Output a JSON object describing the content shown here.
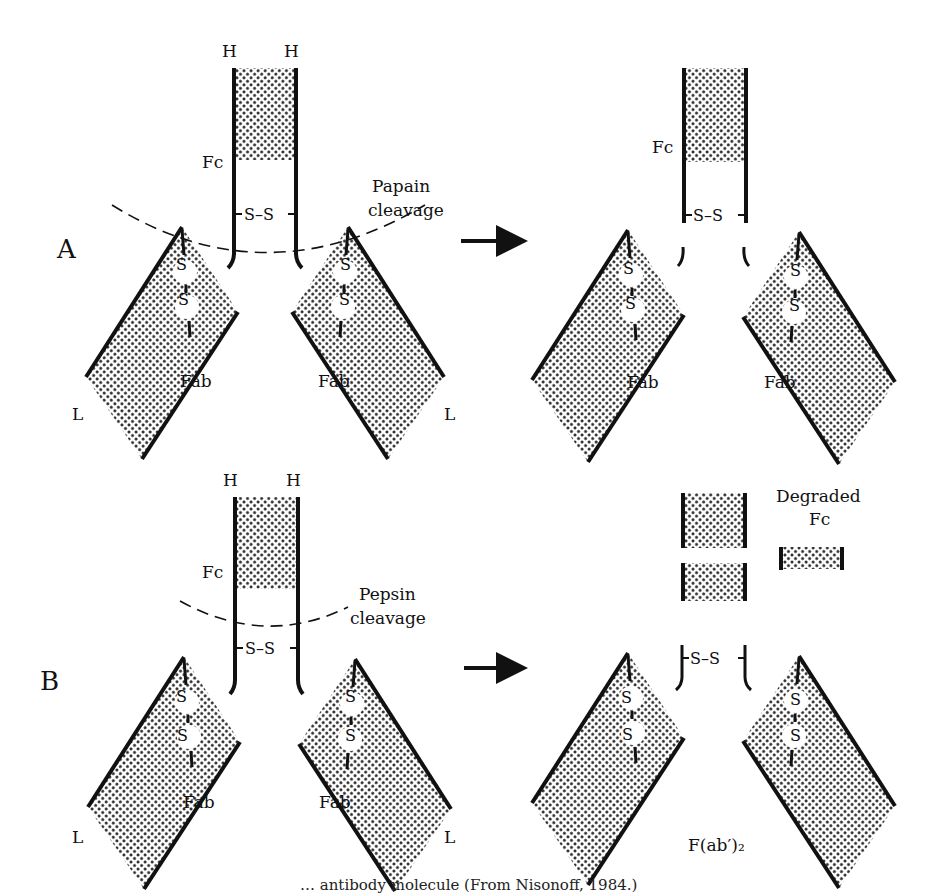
{
  "figure": {
    "panels": [
      {
        "id": "A",
        "label": "A",
        "enzyme_label_line1": "Papain",
        "enzyme_label_line2": "cleavage",
        "chain_labels": {
          "heavy_left": "H",
          "heavy_right": "H",
          "light_left": "L",
          "light_right": "L"
        },
        "fc_label": "Fc",
        "fab_label": "Fab",
        "disulfide": "S–S",
        "intrachain_s": "S",
        "products": {
          "fc_label": "Fc",
          "fab_label": "Fab",
          "disulfide": "S–S"
        }
      },
      {
        "id": "B",
        "label": "B",
        "enzyme_label_line1": "Pepsin",
        "enzyme_label_line2": "cleavage",
        "chain_labels": {
          "heavy_left": "H",
          "heavy_right": "H",
          "light_left": "L",
          "light_right": "L"
        },
        "fc_label": "Fc",
        "fab_label": "Fab",
        "disulfide": "S–S",
        "intrachain_s": "S",
        "products": {
          "degraded_line1": "Degraded",
          "degraded_line2": "Fc",
          "fab2_label": "F(ab′)₂",
          "disulfide": "S–S"
        }
      }
    ],
    "caption_partial": "… antibody molecule (From Nisonoff, 1984.)"
  },
  "colors": {
    "ink": "#111111",
    "background": "#ffffff",
    "stipple": "#333333"
  }
}
